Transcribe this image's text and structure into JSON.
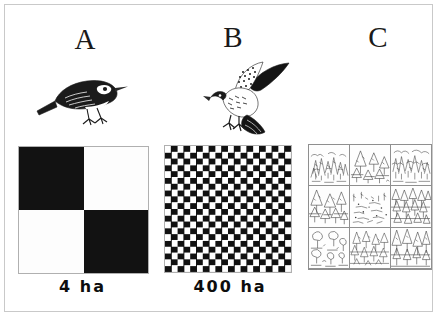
{
  "figure": {
    "type": "scientific-figure",
    "border_color": "#9a9a9a",
    "background_color": "#ffffff",
    "ink_color": "#121212"
  },
  "panels": [
    {
      "letter": "A",
      "bird": {
        "icon_name": "songbird-perched-icon",
        "common_type": "small perched songbird (warbler)",
        "posture": "perched facing right"
      },
      "landscape": {
        "pattern": "checkerboard",
        "columns": 2,
        "rows": 2,
        "dark_cells": [
          "top-left",
          "bottom-right"
        ],
        "light_cells": [
          "top-right",
          "bottom-left"
        ],
        "dark_color": "#121212",
        "light_color": "#fdfdfd"
      },
      "size_label": "4  ha"
    },
    {
      "letter": "B",
      "bird": {
        "icon_name": "raptor-hawk-icon",
        "common_type": "raptor / hawk with spread wings",
        "posture": "wings raised, talons extended"
      },
      "landscape": {
        "pattern": "checkerboard",
        "columns": 20,
        "rows": 20,
        "dark_color": "#111111",
        "light_color": "#ffffff"
      },
      "size_label": "400 ha"
    },
    {
      "letter": "C",
      "bird": null,
      "landscape": {
        "pattern": "sketch-mosaic",
        "columns": 3,
        "rows": 3,
        "cells": [
          {
            "position": "top-left",
            "content": "dense mixed woodland sketch"
          },
          {
            "position": "top-center",
            "content": "open stand of conifers sketch"
          },
          {
            "position": "top-right",
            "content": "dense scrubby forest sketch"
          },
          {
            "position": "middle-left",
            "content": "conifer stand sketch"
          },
          {
            "position": "middle-center",
            "content": "sparse cleared opening sketch"
          },
          {
            "position": "middle-right",
            "content": "dense conifer forest sketch"
          },
          {
            "position": "bottom-left",
            "content": "scattered broadleaf shrubs sketch"
          },
          {
            "position": "bottom-center",
            "content": "mixed conifer regrowth sketch"
          },
          {
            "position": "bottom-right",
            "content": "tall conifer forest sketch"
          }
        ],
        "line_color": "#3a3a3a"
      },
      "size_label": ""
    }
  ]
}
